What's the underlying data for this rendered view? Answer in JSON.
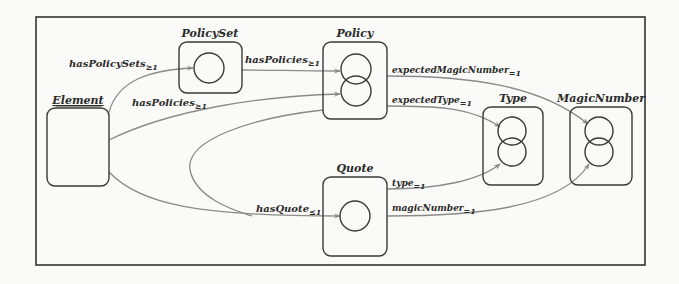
{
  "diagram": {
    "type": "shape-graph",
    "colors": {
      "background": "#fafaf8",
      "frame": "#333333",
      "node_border": "#3a3a3a",
      "edge": "#8a8a8a",
      "text": "#2a2a2a"
    },
    "nodes": [
      {
        "id": "element",
        "label": "Element",
        "underlined": true,
        "circles": 0
      },
      {
        "id": "policyset",
        "label": "PolicySet",
        "circles": 1
      },
      {
        "id": "policy",
        "label": "Policy",
        "circles": 2
      },
      {
        "id": "type",
        "label": "Type",
        "circles": 2
      },
      {
        "id": "magicnumber",
        "label": "MagicNumber",
        "circles": 2
      },
      {
        "id": "quote",
        "label": "Quote",
        "circles": 1
      }
    ],
    "edges": [
      {
        "from": "element",
        "to": "policyset",
        "label": "hasPolicySets",
        "card": "≥1"
      },
      {
        "from": "policyset",
        "to": "policy",
        "label": "hasPolicies",
        "card": "≥1"
      },
      {
        "from": "element",
        "to": "policy",
        "label": "hasPolicies",
        "card": "≥1"
      },
      {
        "from": "policy",
        "to": "magicnumber",
        "label": "expectedMagicNumber",
        "card": "=1"
      },
      {
        "from": "policy",
        "to": "type",
        "label": "expectedType",
        "card": "=1"
      },
      {
        "from": "element",
        "to": "quote",
        "label": "hasQuote",
        "card": "≤1"
      },
      {
        "from": "policy",
        "to": "quote",
        "label": "hasQuote",
        "card": "≤1"
      },
      {
        "from": "quote",
        "to": "type",
        "label": "type",
        "card": "=1"
      },
      {
        "from": "quote",
        "to": "magicnumber",
        "label": "magicNumber",
        "card": "=1"
      }
    ]
  }
}
